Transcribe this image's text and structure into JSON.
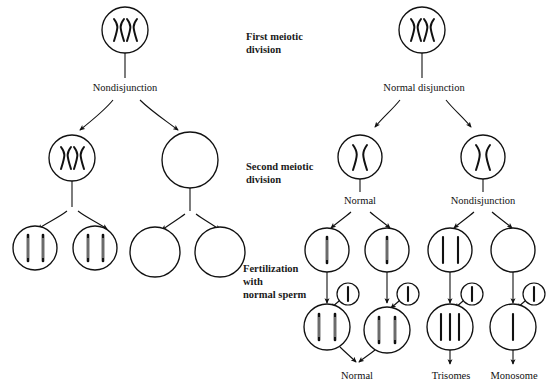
{
  "figure": {
    "background_color": "#ffffff",
    "ink_color": "#111111",
    "width": 553,
    "height": 386
  },
  "stage_labels": [
    {
      "id": "first-meiotic-division",
      "line1": "First meiotic",
      "line2": "division",
      "line3": ""
    },
    {
      "id": "second-meiotic-division",
      "line1": "Second meiotic",
      "line2": "division",
      "line3": ""
    },
    {
      "id": "fertilization",
      "line1": "Fertilization",
      "line2": "with",
      "line3": "normal sperm"
    }
  ],
  "left_pathway": {
    "id": "left-pathway",
    "first_division_label": "Nondisjunction",
    "parent_cell": {
      "id": "left-parent-cell",
      "chromosomes": "XX",
      "count": 2,
      "type": "x-shaped"
    },
    "secondary_cells": [
      {
        "id": "left-secondary-cell-1",
        "chromosomes": "XX",
        "count": 2,
        "type": "x-shaped"
      },
      {
        "id": "left-secondary-cell-2",
        "chromosomes": "",
        "count": 0,
        "type": "empty"
      }
    ],
    "gametes": [
      {
        "id": "left-gamete-1",
        "count": 2,
        "type": "bar"
      },
      {
        "id": "left-gamete-2",
        "count": 2,
        "type": "bar"
      },
      {
        "id": "left-gamete-3",
        "count": 0,
        "type": "empty"
      },
      {
        "id": "left-gamete-4",
        "count": 0,
        "type": "empty"
      }
    ]
  },
  "right_pathway": {
    "id": "right-pathway",
    "first_division_label": "Normal disjunction",
    "parent_cell": {
      "id": "right-parent-cell",
      "chromosomes": "XX",
      "count": 2,
      "type": "x-shaped"
    },
    "secondary_cells": [
      {
        "id": "right-secondary-cell-1",
        "chromosomes": "X",
        "count": 1,
        "type": "x-shaped",
        "label": "Normal"
      },
      {
        "id": "right-secondary-cell-2",
        "chromosomes": "X",
        "count": 1,
        "type": "x-shaped",
        "label": "Nondisjunction"
      }
    ],
    "second_division_labels": [
      "Normal",
      "Nondisjunction"
    ],
    "gametes": [
      {
        "id": "right-gamete-1",
        "count": 1,
        "type": "bar"
      },
      {
        "id": "right-gamete-2",
        "count": 1,
        "type": "bar"
      },
      {
        "id": "right-gamete-3",
        "count": 2,
        "type": "bar"
      },
      {
        "id": "right-gamete-4",
        "count": 0,
        "type": "empty"
      }
    ],
    "sperm": [
      {
        "id": "sperm-1",
        "count": 1,
        "type": "bar"
      },
      {
        "id": "sperm-2",
        "count": 1,
        "type": "bar"
      },
      {
        "id": "sperm-3",
        "count": 1,
        "type": "bar"
      },
      {
        "id": "sperm-4",
        "count": 1,
        "type": "bar"
      }
    ],
    "zygotes": [
      {
        "id": "zygote-1",
        "count": 2,
        "type": "bar",
        "outcome": "Normal"
      },
      {
        "id": "zygote-2",
        "count": 2,
        "type": "bar",
        "outcome": "Normal"
      },
      {
        "id": "zygote-3",
        "count": 3,
        "type": "bar",
        "outcome": "Trisomes"
      },
      {
        "id": "zygote-4",
        "count": 1,
        "type": "bar",
        "outcome": "Monosome"
      }
    ],
    "outcome_labels": [
      "Normal",
      "Trisomes",
      "Monosome"
    ]
  }
}
